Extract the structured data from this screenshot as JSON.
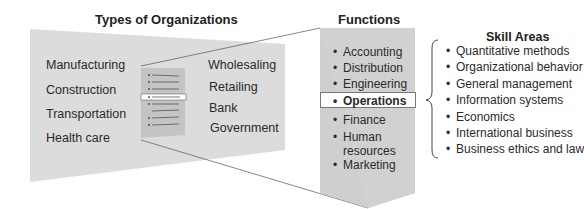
{
  "organizations": {
    "title": "Types of Organizations",
    "left_column": [
      "Manufacturing",
      "Construction",
      "Transportation",
      "Health care"
    ],
    "right_column": [
      "Wholesaling",
      "Retailing",
      "Bank",
      "Government"
    ]
  },
  "functions": {
    "title": "Functions",
    "items": [
      {
        "label": "Accounting",
        "highlighted": false
      },
      {
        "label": "Distribution",
        "highlighted": false
      },
      {
        "label": "Engineering",
        "highlighted": false
      },
      {
        "label": "Operations",
        "highlighted": true
      },
      {
        "label": "Finance",
        "highlighted": false
      },
      {
        "label": "Human",
        "label2": "resources",
        "highlighted": false
      },
      {
        "label": "Marketing",
        "highlighted": false
      }
    ]
  },
  "skills": {
    "title": "Skill Areas",
    "items": [
      "Quantitative methods",
      "Organizational behavior",
      "General management",
      "Information systems",
      "Economics",
      "International business",
      "Business ethics and law"
    ]
  },
  "bullet_glyph": "•",
  "colors": {
    "panel_gray": "#d9d9d9",
    "functions_gray": "#cfcfcf",
    "mini_panel": "#bfbfbf",
    "line": "#555555",
    "highlight_bg": "#ffffff"
  }
}
